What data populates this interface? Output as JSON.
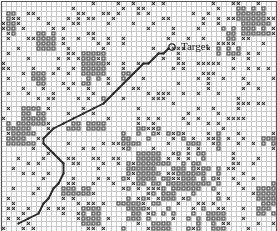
{
  "figure": {
    "title": "",
    "width": 277,
    "height": 231,
    "background": "#ffffff"
  },
  "annotations": {
    "target": {
      "label": "Target",
      "marker": "circle-marker",
      "marker_x": 172,
      "marker_y": 47,
      "label_x": 181,
      "label_y": 41
    }
  },
  "colors": {
    "grid_line": "#c8c8c8",
    "border": "#555555",
    "obstacle": "#4d4d4d",
    "cross": "#3a3a3a",
    "path": "#2b2b2b",
    "background": "#ffffff"
  },
  "chart_data": {
    "type": "heatmap",
    "title": "",
    "xlabel": "",
    "ylabel": "",
    "grid": true,
    "legend": false,
    "cell_size": 5,
    "cols": 55,
    "rows": 46,
    "xlim": [
      0,
      55
    ],
    "ylim": [
      0,
      46
    ],
    "marks": {
      "cross": "X marker cell",
      "box": "filled obstacle cell",
      "empty": "free cell"
    },
    "path_points": [
      [
        3,
        44
      ],
      [
        5,
        43
      ],
      [
        7,
        42
      ],
      [
        8,
        40
      ],
      [
        9,
        39
      ],
      [
        10,
        37
      ],
      [
        11,
        36
      ],
      [
        12,
        34
      ],
      [
        12,
        32
      ],
      [
        11,
        31
      ],
      [
        10,
        30
      ],
      [
        9,
        29
      ],
      [
        8,
        28
      ],
      [
        8,
        27
      ],
      [
        9,
        26
      ],
      [
        10,
        25
      ],
      [
        12,
        24
      ],
      [
        14,
        23
      ],
      [
        16,
        22
      ],
      [
        18,
        21
      ],
      [
        20,
        20
      ],
      [
        21,
        19
      ],
      [
        22,
        18
      ],
      [
        23,
        17
      ],
      [
        24,
        16
      ],
      [
        25,
        15
      ],
      [
        26,
        14
      ],
      [
        27,
        13
      ],
      [
        28,
        12
      ],
      [
        29,
        12
      ],
      [
        30,
        11
      ],
      [
        31,
        10
      ],
      [
        32,
        10
      ],
      [
        33,
        9
      ]
    ],
    "target_cell": [
      34,
      9
    ]
  }
}
